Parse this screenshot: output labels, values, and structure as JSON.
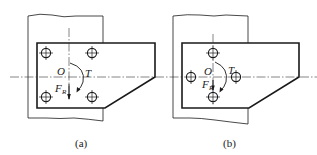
{
  "figure": {
    "panels": [
      {
        "id": "a",
        "caption": "(a)",
        "center_label": "O",
        "torque_label": "T",
        "force_label": "F",
        "force_subscript": "R",
        "bolt_layout": "rectangular-4",
        "holes": [
          [
            46,
            53
          ],
          [
            92,
            53
          ],
          [
            46,
            97
          ],
          [
            92,
            97
          ]
        ],
        "center": [
          69,
          77
        ]
      },
      {
        "id": "b",
        "caption": "(b)",
        "center_label": "O",
        "torque_label": "T",
        "force_label": "F",
        "force_subscript": "R",
        "bolt_layout": "diamond-4",
        "holes": [
          [
            213,
            53
          ],
          [
            191,
            77
          ],
          [
            236,
            77
          ],
          [
            213,
            97
          ]
        ],
        "center": [
          213,
          77
        ]
      }
    ],
    "colors": {
      "line": "#1a1a1a",
      "background": "#ffffff"
    }
  }
}
